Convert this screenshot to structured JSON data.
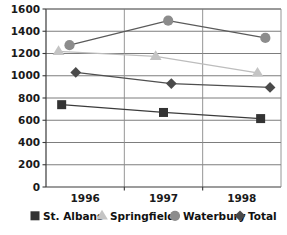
{
  "chart_data": {
    "type": "line",
    "title": "",
    "subtitle": "",
    "xlabel": "",
    "ylabel": "",
    "x": [
      1996,
      1997,
      1998
    ],
    "categories": [
      "1996",
      "1997",
      "1998"
    ],
    "xtick_labels": [
      "1996",
      "1997",
      "1998"
    ],
    "ytick_labels": [
      "0",
      "200",
      "400",
      "600",
      "800",
      "1000",
      "1200",
      "1400",
      "1600"
    ],
    "yticks": [
      0,
      200,
      400,
      600,
      800,
      1000,
      1200,
      1400,
      1600
    ],
    "ylim": [
      0,
      1600
    ],
    "grid": "horizontal-and-vertical",
    "legend_position": "bottom",
    "series": [
      {
        "name": "St. Albans",
        "marker": "square",
        "color": "#333333",
        "line_color": "#3b3b3b",
        "values": [
          740,
          670,
          615
        ]
      },
      {
        "name": "Springfield",
        "marker": "triangle",
        "color": "#c4c4c4",
        "line_color": "#bdbdbd",
        "values": [
          1220,
          1175,
          1025
        ]
      },
      {
        "name": "Waterbury",
        "marker": "circle",
        "color": "#8c8c8c",
        "line_color": "#5a5a5a",
        "values": [
          1275,
          1495,
          1340
        ]
      },
      {
        "name": "Total",
        "marker": "diamond",
        "color": "#4a4a4a",
        "line_color": "#4f4f4f",
        "values": [
          1030,
          930,
          895
        ]
      }
    ]
  },
  "legend": {
    "items": [
      {
        "label": "St. Albans",
        "marker": "square",
        "color": "#333333"
      },
      {
        "label": "Springfield",
        "marker": "triangle",
        "color": "#c4c4c4"
      },
      {
        "label": "Waterbury",
        "marker": "circle",
        "color": "#8c8c8c"
      },
      {
        "label": "Total",
        "marker": "diamond",
        "color": "#4a4a4a"
      }
    ]
  },
  "axes": {
    "y_label_1600": "1600",
    "y_label_1400": "1400",
    "y_label_1200": "1200",
    "y_label_1000": "1000",
    "y_label_800": "800",
    "y_label_600": "600",
    "y_label_400": "400",
    "y_label_200": "200",
    "y_label_0": "0",
    "x_label_1996": "1996",
    "x_label_1997": "1997",
    "x_label_1998": "1998"
  },
  "colors": {
    "background": "#ffffff",
    "axis": "#3a3a3a",
    "grid": "#6e6e6e",
    "text": "#1a1a1a"
  }
}
